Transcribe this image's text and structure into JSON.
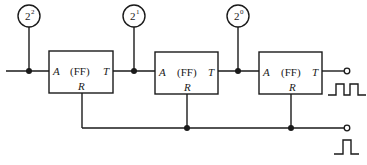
{
  "diagram": {
    "title": "",
    "flip_flops": [
      {
        "label": "(FF)",
        "input": "A",
        "output": "T",
        "reset": "R"
      },
      {
        "label": "(FF)",
        "input": "A",
        "output": "T",
        "reset": "R"
      },
      {
        "label": "(FF)",
        "input": "A",
        "output": "T",
        "reset": "R"
      }
    ],
    "indicators": [
      {
        "base": "2",
        "exp": "2"
      },
      {
        "base": "2",
        "exp": "1"
      },
      {
        "base": "2",
        "exp": "0"
      }
    ],
    "outputs": {
      "pulse_train": "square-wave",
      "reset_pulse": "single-pulse"
    },
    "colors": {
      "line": "#1a1a1a",
      "background": "#ffffff"
    }
  }
}
